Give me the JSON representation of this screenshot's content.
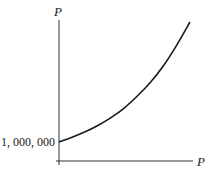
{
  "chart_data": {
    "type": "line",
    "title": "",
    "xlabel": "P",
    "ylabel": "P",
    "y_tick_labels": [
      "1, 000, 000"
    ],
    "y_intercept": 1000000,
    "curve_shape": "exponential-growth",
    "series": [
      {
        "name": "P",
        "x": [
          0,
          0.1,
          0.2,
          0.3,
          0.4,
          0.5,
          0.6,
          0.7,
          0.8,
          0.9,
          1.0
        ],
        "y_relative": [
          0,
          0.04,
          0.085,
          0.14,
          0.205,
          0.285,
          0.385,
          0.5,
          0.64,
          0.81,
          1.0
        ]
      }
    ],
    "grid": false,
    "legend": "none"
  }
}
